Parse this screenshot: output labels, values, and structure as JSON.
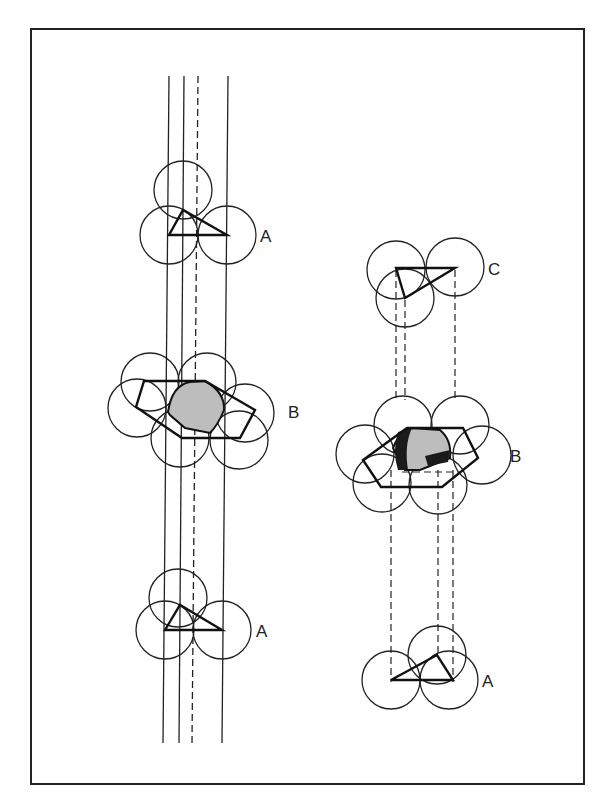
{
  "figure": {
    "left_stack": {
      "name": "hexagonal-close-packing",
      "layers": [
        {
          "label": "A",
          "position": "top"
        },
        {
          "label": "B",
          "position": "middle"
        },
        {
          "label": "A",
          "position": "bottom"
        }
      ]
    },
    "right_stack": {
      "name": "cubic-close-packing",
      "layers": [
        {
          "label": "C",
          "position": "top"
        },
        {
          "label": "B",
          "position": "middle"
        },
        {
          "label": "A",
          "position": "bottom"
        }
      ]
    },
    "colors": {
      "line": "#222222",
      "void_fill": "#bdbdbd",
      "void_dark": "#1a1a1a",
      "background": "#ffffff"
    }
  }
}
